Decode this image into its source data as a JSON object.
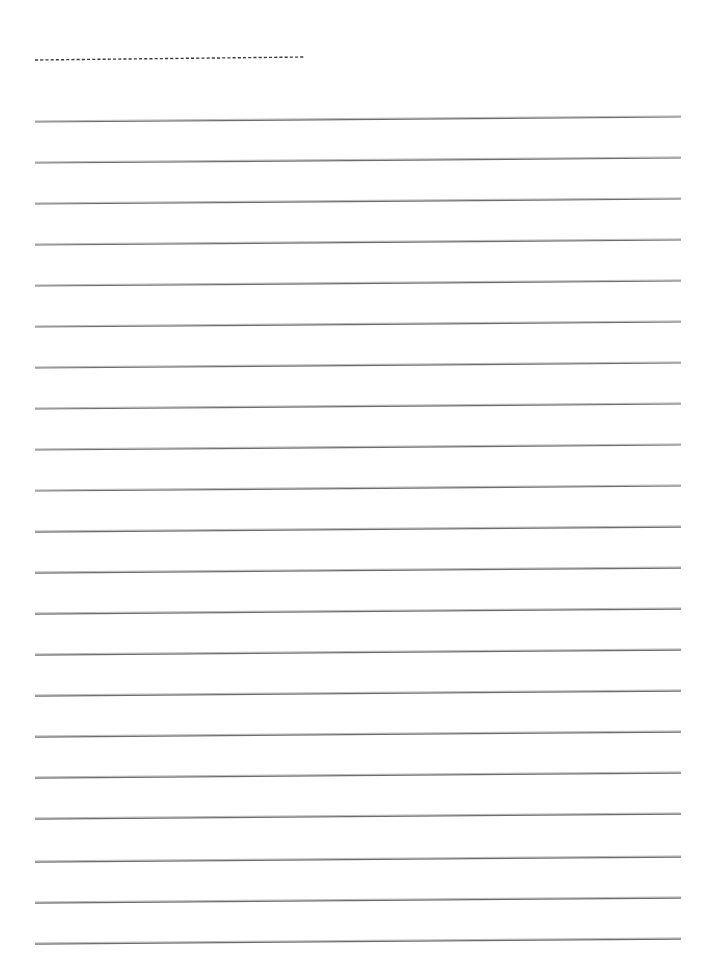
{
  "document": {
    "kind": "lined-writing-paper",
    "title": "",
    "background_color": "#ffffff",
    "page_width": 709,
    "page_height": 969,
    "visible_text": "",
    "note": ""
  },
  "ink": {
    "rule_color": "#6d6d6d",
    "rule_highlight_color": "#b9b9b9",
    "dash_color": "#3c3c3c"
  },
  "geometry": {
    "left_margin_x": 35,
    "right_margin_x": 681,
    "skew_rise_px": -5,
    "rule_stroke_width": 1.25,
    "dash_stroke_width": 1.4,
    "dash_pattern": "3.1 2.1"
  },
  "header_guide": {
    "name": "dashed-header-rule",
    "x_start": 35,
    "x_end": 305,
    "y_start": 60,
    "y_end": 57,
    "style": "dashed"
  },
  "ruled_lines": [
    {
      "index": 1,
      "y_left": 122,
      "y_right": 117
    },
    {
      "index": 2,
      "y_left": 163,
      "y_right": 158
    },
    {
      "index": 3,
      "y_left": 204,
      "y_right": 199
    },
    {
      "index": 4,
      "y_left": 245,
      "y_right": 240
    },
    {
      "index": 5,
      "y_left": 286,
      "y_right": 281
    },
    {
      "index": 6,
      "y_left": 327,
      "y_right": 322
    },
    {
      "index": 7,
      "y_left": 368,
      "y_right": 363
    },
    {
      "index": 8,
      "y_left": 409,
      "y_right": 404
    },
    {
      "index": 9,
      "y_left": 450,
      "y_right": 445
    },
    {
      "index": 10,
      "y_left": 491,
      "y_right": 486
    },
    {
      "index": 11,
      "y_left": 532,
      "y_right": 527
    },
    {
      "index": 12,
      "y_left": 573,
      "y_right": 568
    },
    {
      "index": 13,
      "y_left": 614,
      "y_right": 609
    },
    {
      "index": 14,
      "y_left": 655,
      "y_right": 650
    },
    {
      "index": 15,
      "y_left": 696,
      "y_right": 691
    },
    {
      "index": 16,
      "y_left": 737,
      "y_right": 732
    },
    {
      "index": 17,
      "y_left": 778,
      "y_right": 773
    },
    {
      "index": 18,
      "y_left": 819,
      "y_right": 814
    },
    {
      "index": 19,
      "y_left": 862,
      "y_right": 857
    },
    {
      "index": 20,
      "y_left": 903,
      "y_right": 898
    },
    {
      "index": 21,
      "y_left": 944,
      "y_right": 939
    }
  ]
}
